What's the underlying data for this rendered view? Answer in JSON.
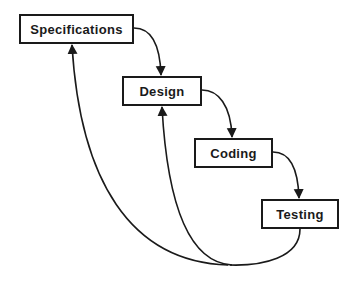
{
  "diagram": {
    "type": "waterfall-process",
    "stages": [
      {
        "id": "specifications",
        "label": "Specifications",
        "x": 19,
        "y": 14,
        "w": 115,
        "h": 30
      },
      {
        "id": "design",
        "label": "Design",
        "x": 122,
        "y": 76,
        "w": 80,
        "h": 30
      },
      {
        "id": "coding",
        "label": "Coding",
        "x": 194,
        "y": 138,
        "w": 79,
        "h": 30
      },
      {
        "id": "testing",
        "label": "Testing",
        "x": 261,
        "y": 199,
        "w": 78,
        "h": 30
      }
    ],
    "edges": [
      {
        "from": "specifications",
        "to": "design",
        "kind": "forward"
      },
      {
        "from": "design",
        "to": "coding",
        "kind": "forward"
      },
      {
        "from": "coding",
        "to": "testing",
        "kind": "forward"
      },
      {
        "from": "testing",
        "to": "design",
        "kind": "feedback"
      },
      {
        "from": "testing",
        "to": "specifications",
        "kind": "feedback"
      }
    ],
    "colors": {
      "stroke": "#1a1a1a",
      "background": "#ffffff"
    }
  }
}
